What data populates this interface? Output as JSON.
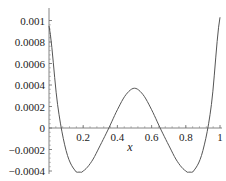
{
  "chart_data": {
    "type": "line",
    "title": "",
    "xlabel": "x",
    "ylabel": "",
    "xlim": [
      0,
      1
    ],
    "ylim": [
      -0.00045,
      0.00105
    ],
    "grid": false,
    "legend": null,
    "x_ticks": [
      "0.2",
      "0.4",
      "0.6",
      "0.8",
      "1"
    ],
    "y_ticks": [
      "0.001",
      "0.0008",
      "0.0006",
      "0.0004",
      "0.0002",
      "0",
      "−0.0002",
      "−0.0004"
    ],
    "series": [
      {
        "name": "f(x)",
        "color": "#555555",
        "x": [
          0.0,
          0.05,
          0.1,
          0.15,
          0.18,
          0.2,
          0.25,
          0.3,
          0.35,
          0.4,
          0.45,
          0.5,
          0.55,
          0.6,
          0.65,
          0.7,
          0.75,
          0.8,
          0.82,
          0.85,
          0.9,
          0.95,
          1.0
        ],
        "y": [
          0.00095,
          0.00022,
          -0.00021,
          -0.00039,
          -0.00041,
          -0.0004,
          -0.00031,
          -0.00016,
          0.0,
          0.00017,
          0.00031,
          0.00037,
          0.00031,
          0.00017,
          0.0,
          -0.00016,
          -0.00031,
          -0.0004,
          -0.00041,
          -0.00039,
          -0.00021,
          0.00022,
          0.00103
        ]
      }
    ]
  }
}
